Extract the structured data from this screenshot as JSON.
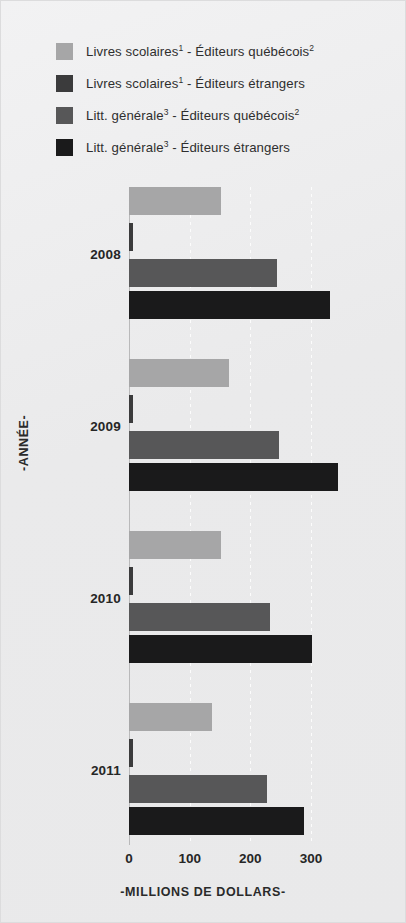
{
  "chart_data": {
    "type": "bar",
    "orientation": "horizontal",
    "title": "",
    "xlabel": "-MILLIONS DE DOLLARS-",
    "ylabel": "-ANNÉE-",
    "xlim": [
      0,
      350
    ],
    "ticks": [
      0,
      100,
      200,
      300
    ],
    "tick_labels": [
      "0",
      "100",
      "200",
      "300"
    ],
    "grid": "dotted-white-vertical",
    "legend_position": "top",
    "categories": [
      "2008",
      "2009",
      "2010",
      "2011"
    ],
    "series": [
      {
        "name": "Livres scolaires¹ - Éditeurs québécois²",
        "color": "#a6a6a7",
        "values": [
          151,
          165,
          151,
          136
        ]
      },
      {
        "name": "Livres scolaires¹ - Éditeurs étrangers",
        "color": "#3b3b3c",
        "values": [
          6,
          6,
          6,
          6
        ]
      },
      {
        "name": "Litt. générale³ - Éditeurs québécois²",
        "color": "#575758",
        "values": [
          244,
          247,
          232,
          227
        ]
      },
      {
        "name": "Litt. générale³ - Éditeurs étrangers",
        "color": "#1a1a1b",
        "values": [
          331,
          344,
          300,
          288
        ]
      }
    ]
  },
  "legend": {
    "items": [
      {
        "label_main": "Livres scolaires",
        "sup1": "1",
        "mid": " - Éditeurs québécois",
        "sup2": "2",
        "color": "#a6a6a7"
      },
      {
        "label_main": "Livres scolaires",
        "sup1": "1",
        "mid": " - Éditeurs étrangers",
        "sup2": "",
        "color": "#3b3b3c"
      },
      {
        "label_main": "Litt. générale",
        "sup1": "3",
        "mid": " - Éditeurs québécois",
        "sup2": "2",
        "color": "#575758"
      },
      {
        "label_main": "Litt. générale",
        "sup1": "3",
        "mid": " - Éditeurs étrangers",
        "sup2": "",
        "color": "#1a1a1b"
      }
    ]
  },
  "axis": {
    "x_title": "-MILLIONS DE DOLLARS-",
    "y_title": "-ANNÉE-",
    "tick_0": "0",
    "tick_1": "100",
    "tick_2": "200",
    "tick_3": "300"
  },
  "years": {
    "y2008": "2008",
    "y2009": "2009",
    "y2010": "2010",
    "y2011": "2011"
  }
}
